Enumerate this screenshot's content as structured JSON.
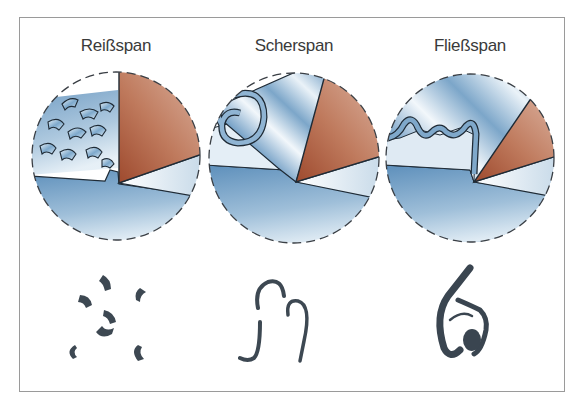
{
  "figure": {
    "panels": [
      {
        "label": "Reißspan",
        "chip_type": "tear-chip",
        "center_x": 116,
        "label_x": 116
      },
      {
        "label": "Scherspan",
        "chip_type": "shear-chip",
        "center_x": 294,
        "label_x": 294
      },
      {
        "label": "Fließspan",
        "chip_type": "flow-chip",
        "center_x": 470,
        "label_x": 470
      }
    ],
    "colors": {
      "frame": "#9a9a9a",
      "tool": "#b0664a",
      "tool_light": "#d9b3a3",
      "workpiece": "#6f9cc4",
      "workpiece_light": "#dbe8f2",
      "chip": "#3c4a57",
      "outline": "#1f2b36"
    }
  }
}
